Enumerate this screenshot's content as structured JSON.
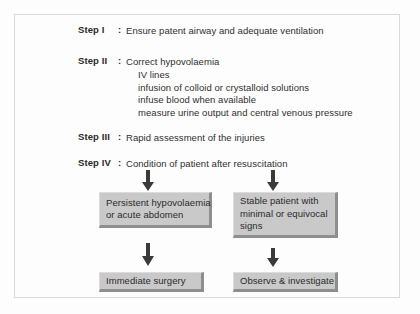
{
  "figure": {
    "background_color": "#fdfdfd",
    "frame_color": "#d8d8d8",
    "box_fill_color": "#c9c9c9",
    "box_shadow_color": "#8e8e8e",
    "text_color": "#2f2f2f",
    "arrow_color": "#3a3a3a"
  },
  "steps": [
    {
      "label": "Step I",
      "colon": ":",
      "text": "Ensure patent airway and adequate ventilation",
      "sub_items": []
    },
    {
      "label": "Step II",
      "colon": ":",
      "text": "Correct hypovolaemia",
      "sub_items": [
        "IV lines",
        "infusion of colloid or crystalloid solutions",
        "infuse blood when available",
        "measure urine output and central venous pressure"
      ]
    },
    {
      "label": "Step III",
      "colon": ":",
      "text": "Rapid assessment of the injuries",
      "sub_items": []
    },
    {
      "label": "Step IV",
      "colon": ":",
      "text": "Condition of patient after resuscitation",
      "sub_items": []
    }
  ],
  "flow": {
    "branches": [
      {
        "condition_box": {
          "lines": [
            "Persistent hypovolaemia",
            "or acute abdomen"
          ]
        },
        "outcome_box": {
          "lines": [
            "Immediate surgery"
          ]
        }
      },
      {
        "condition_box": {
          "lines": [
            "Stable patient with",
            "minimal or equivocal",
            "signs"
          ]
        },
        "outcome_box": {
          "lines": [
            "Observe & investigate"
          ]
        }
      }
    ]
  },
  "arrows": {
    "down_icon": "arrow-down"
  }
}
